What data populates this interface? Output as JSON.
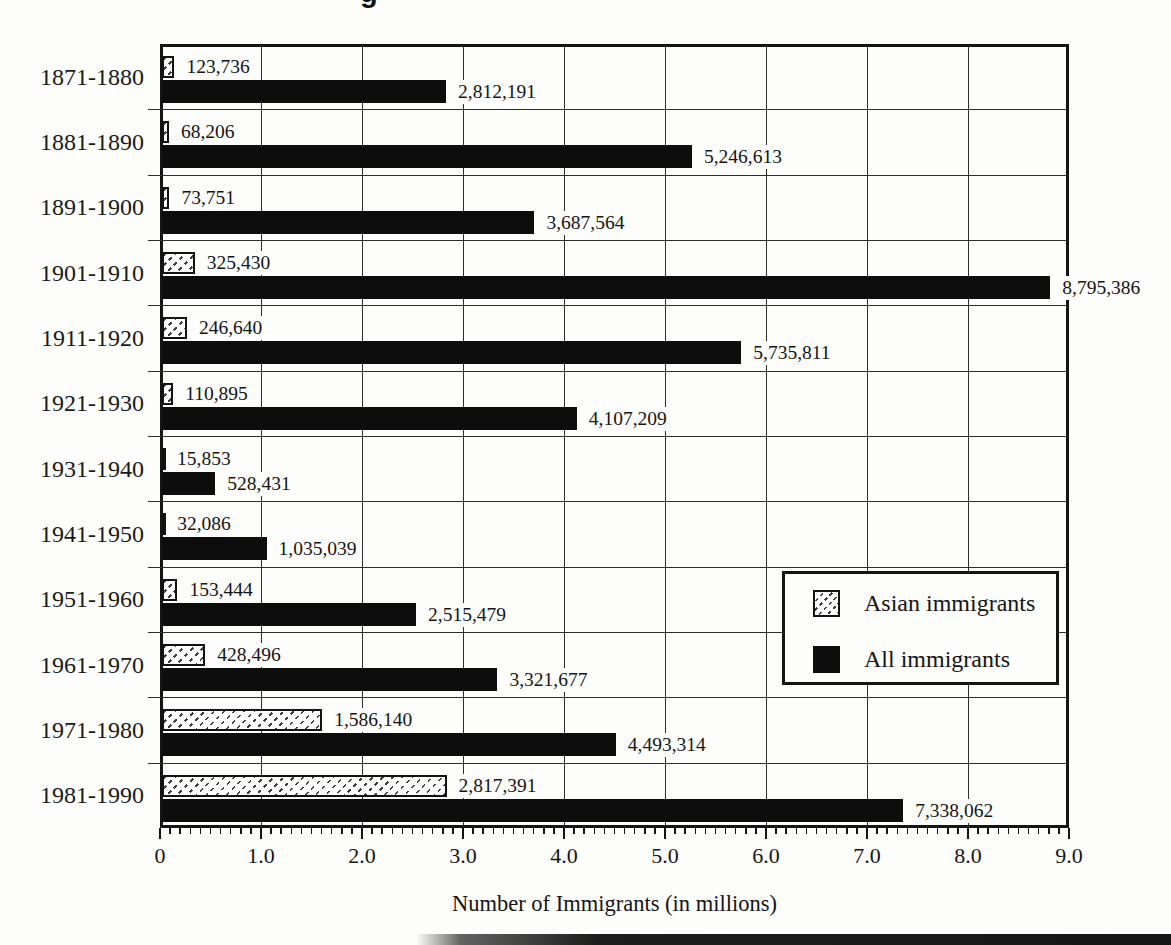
{
  "title_fragment": "g",
  "colors": {
    "bar_black": "#0d0d0d",
    "grid_line": "#2d2d2d",
    "border": "#141414",
    "background": "#fdfdfb",
    "hatch_mark": "#3e3e3e"
  },
  "chart_data": {
    "type": "bar",
    "orientation": "horizontal",
    "xlabel": "Number of Immigrants (in millions)",
    "xlim": [
      0,
      9.0
    ],
    "x_major_ticks": [
      "0",
      "1.0",
      "2.0",
      "3.0",
      "4.0",
      "5.0",
      "6.0",
      "7.0",
      "8.0",
      "9.0"
    ],
    "x_minor_tick_interval": 0.1,
    "grid": true,
    "legend": {
      "position": "center-right-inside-plot",
      "entries": [
        {
          "label": "Asian immigrants",
          "style": "hatched"
        },
        {
          "label": "All immigrants",
          "style": "solid-black"
        }
      ]
    },
    "categories": [
      "1871-1880",
      "1881-1890",
      "1891-1900",
      "1901-1910",
      "1911-1920",
      "1921-1930",
      "1931-1940",
      "1941-1950",
      "1951-1960",
      "1961-1970",
      "1971-1980",
      "1981-1990"
    ],
    "series": [
      {
        "name": "Asian immigrants",
        "values": [
          123736,
          68206,
          73751,
          325430,
          246640,
          110895,
          15853,
          32086,
          153444,
          428496,
          1586140,
          2817391
        ],
        "labels": [
          "123,736",
          "68,206",
          "73,751",
          "325,430",
          "246,640",
          "110,895",
          "15,853",
          "32,086",
          "153,444",
          "428,496",
          "1,586,140",
          "2,817,391"
        ]
      },
      {
        "name": "All immigrants",
        "values": [
          2812191,
          5246613,
          3687564,
          8795386,
          5735811,
          4107209,
          528431,
          1035039,
          2515479,
          3321677,
          4493314,
          7338062
        ],
        "labels": [
          "2,812,191",
          "5,246,613",
          "3,687,564",
          "8,795,386",
          "5,735,811",
          "4,107,209",
          "528,431",
          "1,035,039",
          "2,515,479",
          "3,321,677",
          "4,493,314",
          "7,338,062"
        ]
      }
    ]
  }
}
